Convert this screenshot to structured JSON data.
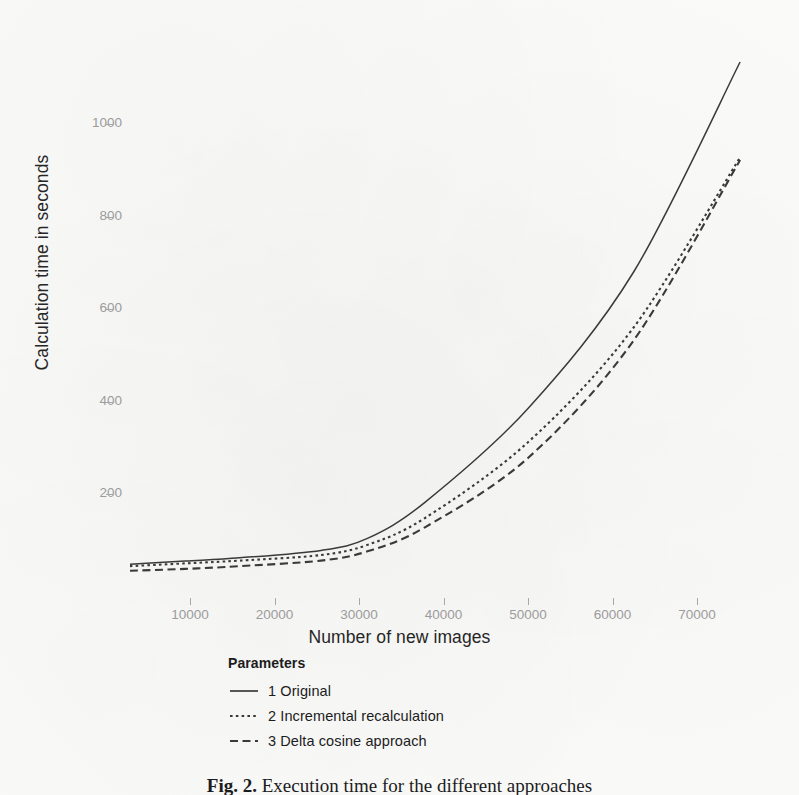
{
  "figure": {
    "caption_prefix": "Fig. 2.",
    "caption_text": "Execution time for the different approaches"
  },
  "chart_data": {
    "type": "line",
    "title": "",
    "xlabel": "Number of new images",
    "ylabel": "Calculation time in seconds",
    "xlim": [
      2000,
      76500
    ],
    "ylim": [
      0,
      1180
    ],
    "xticks": [
      10000,
      20000,
      30000,
      40000,
      50000,
      60000,
      70000
    ],
    "xtick_labels": [
      "10000",
      "20000",
      "30000",
      "40000",
      "50000",
      "60000",
      "70000"
    ],
    "yticks": [
      200,
      400,
      600,
      800,
      1000
    ],
    "ytick_labels": [
      "200",
      "400",
      "600",
      "800",
      "1000"
    ],
    "grid": false,
    "legend_position": "bottom-left",
    "legend_title": "Parameters",
    "x": [
      2900,
      9400,
      15900,
      25500,
      31000,
      37800,
      50000,
      62500,
      75100
    ],
    "series": [
      {
        "name": "1 Original",
        "legend_label": "1 Original",
        "dash": "solid",
        "color": "#3a3a3a",
        "values": [
          48,
          55,
          62,
          78,
          104,
          182,
          385,
          680,
          1134
        ]
      },
      {
        "name": "2 Incremental recalculation",
        "legend_label": "2 Incremental recalculation",
        "dash": "dotted",
        "color": "#3a3a3a",
        "values": [
          44,
          50,
          56,
          68,
          90,
          148,
          312,
          560,
          928
        ]
      },
      {
        "name": "3 Delta cosine approach",
        "legend_label": "3 Delta cosine approach",
        "dash": "dashed",
        "color": "#3a3a3a",
        "values": [
          34,
          38,
          44,
          56,
          76,
          128,
          278,
          532,
          922
        ]
      }
    ]
  },
  "axis_style": {
    "tick_label_color": "#9c9c9c",
    "axis_title_color": "#262626",
    "line_color": "#3a3a3a",
    "panel_background": "#fbfbfa"
  }
}
